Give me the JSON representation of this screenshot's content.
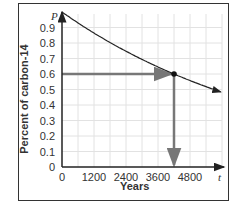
{
  "chart_data": {
    "type": "line",
    "title": "",
    "xlabel": "Years",
    "ylabel": "Percent of carbon-14",
    "x_axis_symbol": "t",
    "y_axis_symbol": "P",
    "xlim": [
      0,
      6000
    ],
    "ylim": [
      0,
      1.0
    ],
    "x_ticks": [
      0,
      1200,
      2400,
      3600,
      4800
    ],
    "x_tick_labels": [
      "0",
      "1200",
      "2400",
      "3600",
      "4800"
    ],
    "y_ticks": [
      0,
      0.1,
      0.2,
      0.3,
      0.4,
      0.5,
      0.6,
      0.7,
      0.8,
      0.9
    ],
    "y_tick_labels": [
      "0",
      "0.1",
      "0.2",
      "0.3",
      "0.4",
      "0.5",
      "0.6",
      "0.7",
      "0.8",
      "0.9"
    ],
    "grid": true,
    "legend": null,
    "series": [
      {
        "name": "Carbon-14 decay P = e^(-kt)",
        "x": [
          0,
          600,
          1200,
          1800,
          2400,
          3000,
          3600,
          4200,
          4800,
          5400,
          6000
        ],
        "values": [
          1.0,
          0.93,
          0.865,
          0.8,
          0.75,
          0.7,
          0.65,
          0.6,
          0.56,
          0.52,
          0.48
        ]
      }
    ],
    "annotations": [
      {
        "type": "point",
        "x": 4200,
        "y": 0.6,
        "label": ""
      },
      {
        "type": "arrow",
        "from": [
          0,
          0.6
        ],
        "to": [
          4200,
          0.6
        ],
        "label": ""
      },
      {
        "type": "arrow",
        "from": [
          4200,
          0.6
        ],
        "to": [
          4200,
          0
        ],
        "label": ""
      }
    ]
  }
}
